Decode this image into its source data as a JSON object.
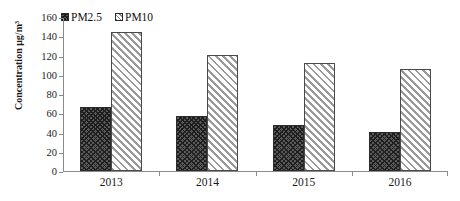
{
  "chart_data": {
    "type": "bar",
    "title": "",
    "xlabel": "",
    "ylabel": "Concentration μg/m³",
    "categories": [
      "2013",
      "2014",
      "2015",
      "2016"
    ],
    "series": [
      {
        "name": "PM2.5",
        "values": [
          67,
          57,
          48,
          41
        ],
        "pattern": "cross-hatch-dark",
        "color": "#5a5a5a"
      },
      {
        "name": "PM10",
        "values": [
          144,
          121,
          112,
          106
        ],
        "pattern": "diagonal-hatch-light",
        "color": "#ffffff"
      }
    ],
    "ylim": [
      0,
      160
    ],
    "ytick_values": [
      160,
      140,
      120,
      100,
      80,
      60,
      40,
      20,
      0
    ],
    "ytick_labels": [
      "160",
      "140",
      "120",
      "100",
      "80",
      "60",
      "40",
      "20",
      "0"
    ],
    "grid": false,
    "legend_position": "top-left",
    "legend_entries": [
      "PM2.5",
      "PM10"
    ]
  }
}
